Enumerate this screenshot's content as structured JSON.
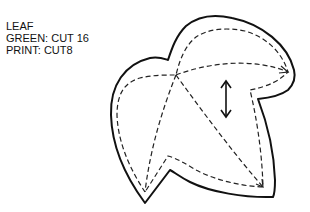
{
  "pattern": {
    "piece_name": "LEAF",
    "cut_instructions": [
      "GREEN: CUT 16",
      "PRINT: CUT8"
    ],
    "grainline_icon": "double-arrow-vertical",
    "colors": {
      "outline": "#111111",
      "stitch_line": "#222222",
      "background": "#ffffff"
    }
  }
}
